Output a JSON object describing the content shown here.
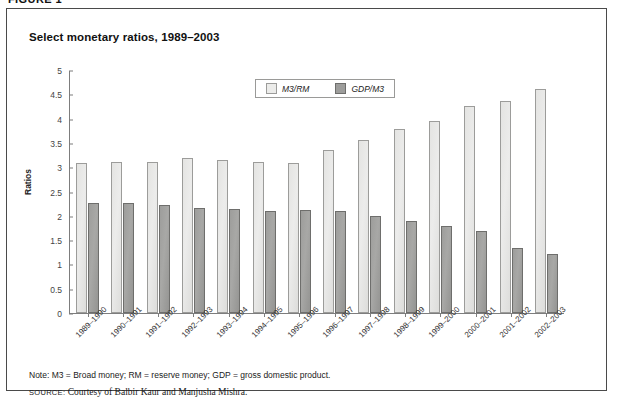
{
  "figure_tag": "FIGURE 1",
  "title": "Select monetary ratios, 1989–2003",
  "legend": {
    "position": "top-center",
    "items": [
      {
        "label": "M3/RM",
        "swatch": "light-gray-square",
        "color": "#ececea"
      },
      {
        "label": "GDP/M3",
        "swatch": "dark-gray-square",
        "color": "#9d9d9b"
      }
    ]
  },
  "note": "Note: M3 = Broad money; RM = reserve money; GDP = gross domestic product.",
  "source_prefix": "source:",
  "source_text": "Courtesy of Balbir Kaur and Manjusha Mishra.",
  "yticks": [
    "5",
    "4.5",
    "4",
    "3.5",
    "3",
    "2.5",
    "2",
    "1.5",
    "1",
    "0.5",
    "0"
  ],
  "chart_data": {
    "type": "bar",
    "title": "Select monetary ratios, 1989–2003",
    "xlabel": "",
    "ylabel": "Ratios",
    "ylim": [
      0,
      5
    ],
    "ytick_step": 0.5,
    "grid": false,
    "legend_position": "top-center",
    "categories": [
      "1989–1990",
      "1990–1991",
      "1991–1992",
      "1992–1993",
      "1993–1994",
      "1994–1995",
      "1995–1996",
      "1996–1997",
      "1997–1998",
      "1998–1999",
      "1999–2000",
      "2000–2001",
      "2001–2002",
      "2002–2003"
    ],
    "series": [
      {
        "name": "M3/RM",
        "color": "#ececea",
        "values": [
          3.1,
          3.12,
          3.11,
          3.2,
          3.17,
          3.11,
          3.09,
          3.37,
          3.58,
          3.8,
          3.97,
          4.27,
          4.38,
          4.62
        ]
      },
      {
        "name": "GDP/M3",
        "color": "#9d9d9b",
        "values": [
          2.28,
          2.27,
          2.24,
          2.17,
          2.15,
          2.11,
          2.13,
          2.1,
          2.01,
          1.91,
          1.8,
          1.7,
          1.34,
          1.22
        ]
      }
    ]
  }
}
